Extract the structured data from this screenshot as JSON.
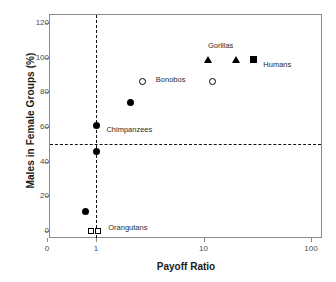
{
  "chart_data": {
    "type": "scatter",
    "title": "",
    "xlabel": "Payoff Ratio",
    "ylabel": "Males in Female Groups (%)",
    "xscale": "log",
    "xtick_labels": [
      "0",
      "1",
      "10",
      "100"
    ],
    "xtick_values": [
      0.35,
      1,
      10,
      100
    ],
    "ytick_labels": [
      "0",
      "20",
      "40",
      "60",
      "80",
      "100",
      "120"
    ],
    "ytick_values": [
      0,
      20,
      40,
      60,
      80,
      100,
      120
    ],
    "ylim": [
      -6,
      130
    ],
    "grid": false,
    "legend": "none",
    "reference_lines": [
      {
        "name": "horizontal-50-percent",
        "orientation": "horizontal",
        "y": 50,
        "style": "dashed"
      },
      {
        "name": "vertical-payoff-ratio-1",
        "orientation": "vertical",
        "x": 1,
        "style": "dashed"
      }
    ],
    "points": [
      {
        "name": "orangutans-open-square-left",
        "x": 0.9,
        "y": 0,
        "marker": "open-square"
      },
      {
        "name": "orangutans-open-square-right",
        "x": 1.05,
        "y": 0,
        "marker": "open-square"
      },
      {
        "name": "filled-circle-low",
        "x": 0.8,
        "y": 11,
        "marker": "filled-circle"
      },
      {
        "name": "filled-circle-46",
        "x": 1.0,
        "y": 46,
        "marker": "filled-circle"
      },
      {
        "name": "chimpanzees-filled-circle-61",
        "x": 1.0,
        "y": 61,
        "marker": "filled-circle"
      },
      {
        "name": "filled-circle-74",
        "x": 2.1,
        "y": 74,
        "marker": "filled-circle"
      },
      {
        "name": "bonobos-open-circle",
        "x": 2.7,
        "y": 86,
        "marker": "open-circle"
      },
      {
        "name": "open-circle-right",
        "x": 12.0,
        "y": 86,
        "marker": "open-circle"
      },
      {
        "name": "gorillas-triangle-left",
        "x": 11.0,
        "y": 99,
        "marker": "filled-triangle"
      },
      {
        "name": "gorillas-triangle-right",
        "x": 20.0,
        "y": 99,
        "marker": "filled-triangle"
      },
      {
        "name": "humans-filled-square",
        "x": 29.0,
        "y": 99,
        "marker": "filled-square"
      }
    ],
    "annotations": [
      {
        "name": "annotation-gorillas",
        "text": "Gorillas",
        "x": 11.0,
        "y": 107
      },
      {
        "name": "annotation-humans",
        "text": "Humans",
        "x": 36.0,
        "y": 96
      },
      {
        "name": "annotation-bonobos",
        "text": "Bonobos",
        "x": 3.6,
        "y": 87
      },
      {
        "name": "annotation-chimpanzees",
        "text": "Chimpanzees",
        "x": 1.25,
        "y": 58
      },
      {
        "name": "annotation-orangutans",
        "text": "Orangutans",
        "x": 1.3,
        "y": 2
      }
    ],
    "colors": {
      "marker": "#000000",
      "frame": "#8c8c8c",
      "text": "#1a1a1a",
      "tick_text": "#4d4d4d",
      "reference_line": "#111111",
      "background": "#ffffff"
    }
  },
  "caption_strip": {
    "text": ""
  }
}
